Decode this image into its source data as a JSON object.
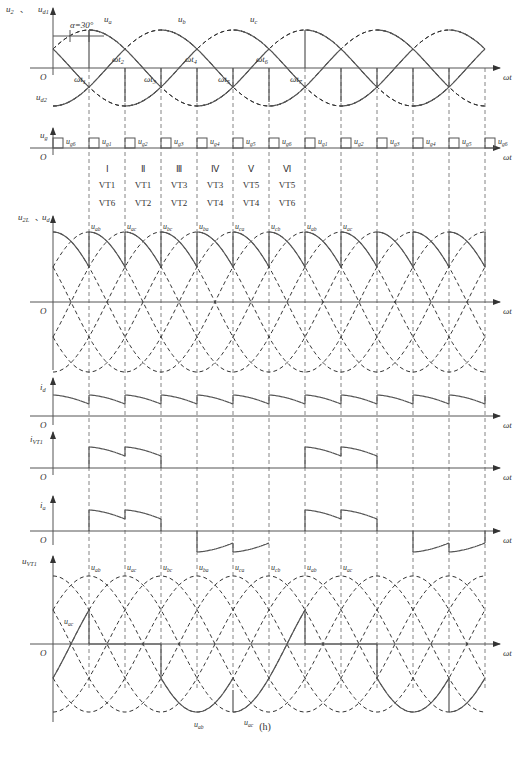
{
  "figure": {
    "caption": "(h)",
    "alpha_label": "α=30°",
    "x_axis_label": "ωt",
    "origin_label": "O"
  },
  "panels": {
    "phase_voltages": {
      "y_label": "u2、ud1",
      "lower_label": "ud2",
      "curve_labels": [
        "ua",
        "ub",
        "uc"
      ],
      "instants": [
        "ωt1",
        "ωt2",
        "ωt3",
        "ωt4",
        "ωt5",
        "ωt6",
        "ωt7"
      ]
    },
    "gate_pulses": {
      "y_label": "ug",
      "pulses": [
        "ug6",
        "ug1",
        "ug2",
        "ug3",
        "ug4",
        "ug5",
        "ug6",
        "ug1",
        "ug2",
        "ug3",
        "ug4",
        "ug5",
        "ug6"
      ]
    },
    "intervals": {
      "numerals": [
        "Ⅰ",
        "Ⅱ",
        "Ⅲ",
        "Ⅳ",
        "Ⅴ",
        "Ⅵ"
      ],
      "upper_thyristor": [
        "VT1",
        "VT1",
        "VT3",
        "VT3",
        "VT5",
        "VT5"
      ],
      "lower_thyristor": [
        "VT6",
        "VT2",
        "VT2",
        "VT4",
        "VT4",
        "VT6"
      ]
    },
    "output_voltage": {
      "y_label": "u2L、ud",
      "segment_labels": [
        "uab",
        "uac",
        "ubc",
        "uba",
        "uca",
        "ucb",
        "uab",
        "uac"
      ]
    },
    "load_current": {
      "y_label": "id"
    },
    "thyristor_current": {
      "y_label": "iVT1"
    },
    "phase_current": {
      "y_label": "ia"
    },
    "thyristor_voltage": {
      "y_label": "uVT1",
      "segment_labels": [
        "uab",
        "uac",
        "ubc",
        "uba",
        "uca",
        "ucb",
        "uab",
        "uac"
      ],
      "side_label": "uac",
      "bottom_labels": [
        "uab",
        "uac"
      ]
    }
  }
}
